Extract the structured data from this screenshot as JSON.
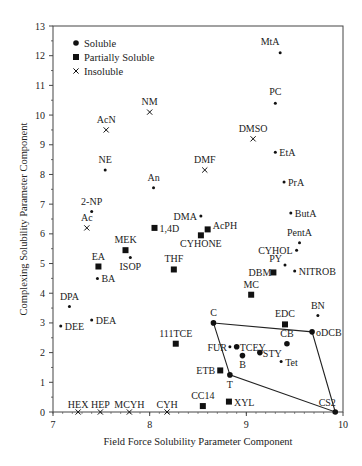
{
  "chart_data": {
    "type": "scatter",
    "title": "",
    "xlabel": "Field Force Solubility Parameter Component",
    "ylabel": "Complexing Solubility Parameter Component",
    "xlim": [
      7,
      10
    ],
    "ylim": [
      0,
      13
    ],
    "x_ticks": [
      7,
      8,
      9,
      10
    ],
    "y_ticks": [
      0,
      1,
      2,
      3,
      4,
      5,
      6,
      7,
      8,
      9,
      10,
      11,
      12,
      13
    ],
    "grid": false,
    "legend": {
      "position": "upper-left",
      "entries": [
        {
          "label": "Soluble",
          "marker": "dot"
        },
        {
          "label": "Partially Soluble",
          "marker": "square"
        },
        {
          "label": "Insoluble",
          "marker": "cross"
        }
      ]
    },
    "series": [
      {
        "name": "Soluble",
        "marker": "dot",
        "points": [
          {
            "label": "MtA",
            "x": 9.35,
            "y": 12.1
          },
          {
            "label": "PC",
            "x": 9.3,
            "y": 10.4
          },
          {
            "label": "EtA",
            "x": 9.3,
            "y": 8.75
          },
          {
            "label": "NE",
            "x": 7.54,
            "y": 8.15
          },
          {
            "label": "PrA",
            "x": 9.39,
            "y": 7.75
          },
          {
            "label": "An",
            "x": 8.04,
            "y": 7.55
          },
          {
            "label": "2-NP",
            "x": 7.4,
            "y": 6.75
          },
          {
            "label": "ButA",
            "x": 9.46,
            "y": 6.7
          },
          {
            "label": "DMA",
            "x": 8.53,
            "y": 6.6
          },
          {
            "label": "PentA",
            "x": 9.55,
            "y": 5.7
          },
          {
            "label": "CYHOL",
            "x": 9.52,
            "y": 5.45
          },
          {
            "label": "ISOP",
            "x": 7.8,
            "y": 5.2
          },
          {
            "label": "PY",
            "x": 9.4,
            "y": 4.95
          },
          {
            "label": "NITROB",
            "x": 9.5,
            "y": 4.75
          },
          {
            "label": "BA",
            "x": 7.46,
            "y": 4.5
          },
          {
            "label": "DPA",
            "x": 7.17,
            "y": 3.55
          },
          {
            "label": "DEA",
            "x": 7.4,
            "y": 3.1
          },
          {
            "label": "DEE",
            "x": 7.08,
            "y": 2.9
          },
          {
            "label": "BN",
            "x": 9.74,
            "y": 3.25
          },
          {
            "label": "C",
            "x": 8.66,
            "y": 3.0
          },
          {
            "label": "oDCB",
            "x": 9.68,
            "y": 2.7
          },
          {
            "label": "CB",
            "x": 9.42,
            "y": 2.3
          },
          {
            "label": "FUR",
            "x": 8.83,
            "y": 2.2
          },
          {
            "label": "TCEY",
            "x": 8.9,
            "y": 2.2
          },
          {
            "label": "STY",
            "x": 9.14,
            "y": 2.0
          },
          {
            "label": "B",
            "x": 8.96,
            "y": 1.9
          },
          {
            "label": "Tet",
            "x": 9.36,
            "y": 1.7
          },
          {
            "label": "T",
            "x": 8.83,
            "y": 1.25
          },
          {
            "label": "CS2",
            "x": 9.92,
            "y": 0.0
          }
        ]
      },
      {
        "name": "Partially Soluble",
        "marker": "square",
        "points": [
          {
            "label": "1,4D",
            "x": 8.05,
            "y": 6.2
          },
          {
            "label": "AcPH",
            "x": 8.6,
            "y": 6.15
          },
          {
            "label": "CYHONE",
            "x": 8.53,
            "y": 5.95
          },
          {
            "label": "MEK",
            "x": 7.75,
            "y": 5.45
          },
          {
            "label": "EA",
            "x": 7.47,
            "y": 4.9
          },
          {
            "label": "THF",
            "x": 8.25,
            "y": 4.8
          },
          {
            "label": "DBM",
            "x": 9.28,
            "y": 4.7
          },
          {
            "label": "MC",
            "x": 9.05,
            "y": 3.95
          },
          {
            "label": "EDC",
            "x": 9.4,
            "y": 2.95
          },
          {
            "label": "111TCE",
            "x": 8.27,
            "y": 2.3
          },
          {
            "label": "ETB",
            "x": 8.73,
            "y": 1.4
          },
          {
            "label": "CC14",
            "x": 8.55,
            "y": 0.2
          },
          {
            "label": "XYL",
            "x": 8.82,
            "y": 0.35
          }
        ]
      },
      {
        "name": "Insoluble",
        "marker": "cross",
        "points": [
          {
            "label": "NM",
            "x": 8.0,
            "y": 10.1
          },
          {
            "label": "AcN",
            "x": 7.55,
            "y": 9.5
          },
          {
            "label": "DMSO",
            "x": 9.07,
            "y": 9.2
          },
          {
            "label": "DMF",
            "x": 8.57,
            "y": 8.15
          },
          {
            "label": "Ac",
            "x": 7.35,
            "y": 6.2
          },
          {
            "label": "HEX",
            "x": 7.26,
            "y": 0.0
          },
          {
            "label": "HEP",
            "x": 7.49,
            "y": 0.0
          },
          {
            "label": "MCYH",
            "x": 7.79,
            "y": 0.0
          },
          {
            "label": "CYH",
            "x": 8.18,
            "y": 0.0
          }
        ]
      }
    ],
    "polygon": {
      "description": "solubility region boundary",
      "vertices": [
        {
          "label": "C",
          "x": 8.66,
          "y": 3.0
        },
        {
          "label": "oDCB",
          "x": 9.68,
          "y": 2.7
        },
        {
          "label": "CS2",
          "x": 9.92,
          "y": 0.0
        },
        {
          "label": "T",
          "x": 8.83,
          "y": 1.25
        }
      ]
    }
  },
  "label_offsets": {
    "MtA": [
      -10,
      -8,
      "middle"
    ],
    "PC": [
      0,
      -8,
      "middle"
    ],
    "NM": [
      0,
      -7,
      "middle"
    ],
    "AcN": [
      0,
      -7,
      "middle"
    ],
    "DMSO": [
      0,
      -7,
      "middle"
    ],
    "EtA": [
      4,
      4,
      "start"
    ],
    "NE": [
      0,
      -7,
      "middle"
    ],
    "DMF": [
      0,
      -7,
      "middle"
    ],
    "PrA": [
      4,
      4,
      "start"
    ],
    "An": [
      0,
      -7,
      "middle"
    ],
    "2-NP": [
      0,
      -7,
      "middle"
    ],
    "ButA": [
      4,
      4,
      "start"
    ],
    "Ac": [
      0,
      -7,
      "middle"
    ],
    "1,4D": [
      5,
      4,
      "start"
    ],
    "DMA": [
      -4,
      4,
      "end"
    ],
    "AcPH": [
      5,
      0,
      "start"
    ],
    "CYHONE": [
      0,
      12,
      "middle"
    ],
    "MEK": [
      0,
      -7,
      "middle"
    ],
    "PentA": [
      0,
      -7,
      "middle"
    ],
    "CYHOL": [
      -4,
      4,
      "end"
    ],
    "ISOP": [
      0,
      12,
      "middle"
    ],
    "EA": [
      0,
      -7,
      "middle"
    ],
    "THF": [
      0,
      -7,
      "middle"
    ],
    "PY": [
      -3,
      -3,
      "end"
    ],
    "DBM": [
      -2,
      4,
      "end"
    ],
    "NITROB": [
      4,
      4,
      "start"
    ],
    "BA": [
      4,
      4,
      "start"
    ],
    "MC": [
      0,
      -7,
      "middle"
    ],
    "DPA": [
      0,
      -7,
      "middle"
    ],
    "DEA": [
      4,
      4,
      "start"
    ],
    "DEE": [
      4,
      4,
      "start"
    ],
    "BN": [
      0,
      -7,
      "middle"
    ],
    "EDC": [
      0,
      -7,
      "middle"
    ],
    "C": [
      0,
      -7,
      "middle"
    ],
    "oDCB": [
      4,
      4,
      "start"
    ],
    "111TCE": [
      0,
      -7,
      "middle"
    ],
    "CB": [
      0,
      -7,
      "middle"
    ],
    "FUR": [
      -3,
      4,
      "end"
    ],
    "TCEY": [
      3,
      4,
      "start"
    ],
    "STY": [
      3,
      4,
      "start"
    ],
    "B": [
      0,
      12,
      "middle"
    ],
    "Tet": [
      4,
      4,
      "start"
    ],
    "ETB": [
      -5,
      4,
      "end"
    ],
    "T": [
      0,
      13,
      "middle"
    ],
    "CC14": [
      0,
      -7,
      "middle"
    ],
    "XYL": [
      5,
      4,
      "start"
    ],
    "CS2": [
      -8,
      -6,
      "middle"
    ],
    "HEX": [
      0,
      -4,
      "middle"
    ],
    "HEP": [
      0,
      -4,
      "middle"
    ],
    "MCYH": [
      0,
      -4,
      "middle"
    ],
    "CYH": [
      0,
      -4,
      "middle"
    ]
  }
}
